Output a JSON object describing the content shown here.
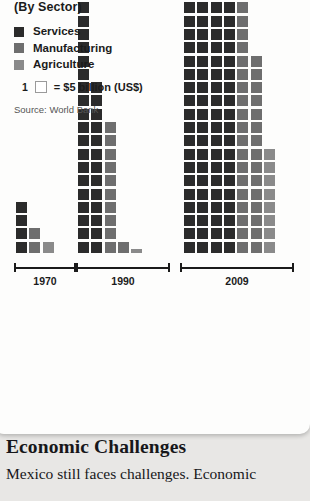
{
  "legend": {
    "title": "(By Sector)",
    "items": [
      {
        "label": "Services",
        "color": "#2b2b2b",
        "key": "services"
      },
      {
        "label": "Manufacturing",
        "color": "#6e6e6e",
        "key": "manufacturing"
      },
      {
        "label": "Agriculture",
        "color": "#8a8a8a",
        "key": "agriculture"
      }
    ],
    "unit_number": "1",
    "unit_text": "= $5 billion (US$)",
    "source": "Source: World Bank"
  },
  "article": {
    "heading": "Economic Challenges",
    "paragraph": "Mexico still faces challenges. Economic"
  },
  "chart_data": {
    "type": "bar",
    "title": "(By Sector)",
    "subtitle": "",
    "xlabel": "",
    "ylabel": "",
    "unit_value": 5,
    "unit_currency": "US$ billion",
    "note": "Each square = $5 billion (US$). Pictogram / waffle column chart; columns are stacked unit squares read bottom-up.",
    "categories": [
      "1970",
      "1990",
      "2009"
    ],
    "series": [
      {
        "name": "Services",
        "color": "#2b2b2b",
        "squares": [
          4,
          24,
          48
        ],
        "values_usd_billion": [
          20,
          120,
          240
        ]
      },
      {
        "name": "Manufacturing",
        "color": "#6e6e6e",
        "squares": [
          2,
          15,
          29
        ],
        "values_usd_billion": [
          10,
          75,
          145
        ]
      },
      {
        "name": "Agriculture",
        "color": "#8a8a8a",
        "squares": [
          1,
          1,
          8
        ],
        "values_usd_billion": [
          5,
          5,
          40
        ]
      }
    ],
    "columns_per_cluster": {
      "1970": [
        {
          "sector": "Services",
          "squares": 4
        },
        {
          "sector": "Manufacturing",
          "squares": 2
        },
        {
          "sector": "Agriculture",
          "squares": 1
        }
      ],
      "1990": [
        {
          "sector": "Services",
          "squares": 20
        },
        {
          "sector": "Services",
          "squares": 13
        },
        {
          "sector": "Manufacturing",
          "squares": 10
        },
        {
          "sector": "Manufacturing",
          "squares": 1
        },
        {
          "sector": "Agriculture",
          "squares": 1,
          "partial": true
        }
      ],
      "2009": [
        {
          "sector": "Services",
          "squares": 31,
          "clipped_top": true
        },
        {
          "sector": "Services",
          "squares": 31,
          "clipped_top": true
        },
        {
          "sector": "Services",
          "squares": 23
        },
        {
          "sector": "Services",
          "squares": 22
        },
        {
          "sector": "Manufacturing",
          "squares": 22
        },
        {
          "sector": "Manufacturing",
          "squares": 15
        },
        {
          "sector": "Agriculture",
          "squares": 8
        }
      ]
    },
    "grid": false,
    "legend_position": "top-left"
  }
}
